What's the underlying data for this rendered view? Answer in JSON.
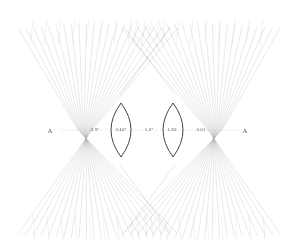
{
  "diagram": {
    "type": "ray-caustic drawing",
    "colors": {
      "line": "#6e6e6e",
      "lens": "#444444",
      "background": "#ffffff"
    },
    "axis_y": 130,
    "labels": [
      {
        "id": "left-A",
        "text": "A",
        "x": 50,
        "y": 130,
        "big": true
      },
      {
        "id": "left-waist-label",
        "text": "2.5°",
        "x": 95,
        "y": 129
      },
      {
        "id": "left-lens-label",
        "text": "3.40°",
        "x": 121,
        "y": 129
      },
      {
        "id": "center-label",
        "text": "1.0°",
        "x": 149,
        "y": 129
      },
      {
        "id": "right-lens-label",
        "text": "1.50",
        "x": 172,
        "y": 129
      },
      {
        "id": "right-waist-label",
        "text": "3.01",
        "x": 201,
        "y": 129
      },
      {
        "id": "right-A",
        "text": "A",
        "x": 245,
        "y": 130,
        "big": true
      }
    ],
    "lenses": [
      {
        "id": "left-lens",
        "cx": 121,
        "top": 103,
        "bottom": 157,
        "half_width": 10
      },
      {
        "id": "right-lens",
        "cx": 173,
        "top": 103,
        "bottom": 157,
        "half_width": 10
      }
    ],
    "fans": [
      {
        "id": "left-fan",
        "waist_x": 85,
        "span_top": [
          18,
          178
        ],
        "span_bottom": [
          18,
          178
        ]
      },
      {
        "id": "right-fan",
        "waist_x": 215,
        "span_top": [
          122,
          280
        ],
        "span_bottom": [
          122,
          280
        ]
      }
    ]
  }
}
